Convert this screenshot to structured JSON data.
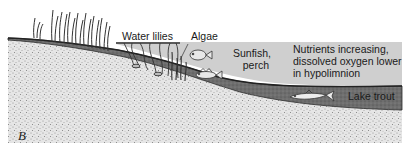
{
  "figure": {
    "panel_letter": "B",
    "colors": {
      "water": "#cfcfcf",
      "sediment": "#6a6a6a",
      "sediment_edge": "#2a2a2a",
      "bedrock": "#e4e4e4",
      "stipple": "#8c8c8c",
      "ink": "#1a1a1a"
    },
    "labels": {
      "water_lilies": "Water lilies",
      "algae": "Algae",
      "sunfish_line1": "Sunfish,",
      "sunfish_line2": "perch",
      "nutrients_line1": "Nutrients increasing,",
      "nutrients_line2": "dissolved oxygen lower",
      "nutrients_line3": "in hypolimnion",
      "lake_trout": "Lake trout"
    },
    "elements": [
      {
        "name": "emergent-reeds",
        "type": "plant"
      },
      {
        "name": "water-lilies",
        "type": "plant"
      },
      {
        "name": "algae",
        "type": "plant"
      },
      {
        "name": "sunfish",
        "type": "fish"
      },
      {
        "name": "perch",
        "type": "fish"
      },
      {
        "name": "lake-trout",
        "type": "fish"
      }
    ]
  }
}
